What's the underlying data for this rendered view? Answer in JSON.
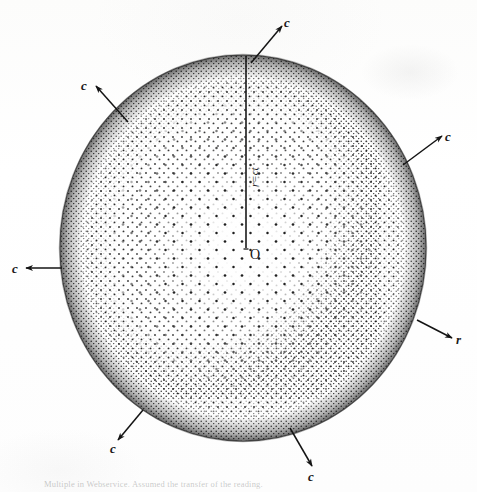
{
  "figure": {
    "background_color": "#fdfdfc",
    "ink_color": "#161616",
    "caption": "Multiple in Webservice. Assumed the transfer of the reading.",
    "sphere": {
      "center_label": "O",
      "center_x": 243,
      "center_y": 248,
      "radius_x": 183,
      "radius_y": 193,
      "edge_color": "#2a2a2a",
      "fill_style": "stipple"
    },
    "radius_line": {
      "label": "r=ct",
      "from_label": "O",
      "direction": "up",
      "x": 246,
      "y_top": 55,
      "y_bottom": 248
    },
    "vectors": [
      {
        "id": "vector-top",
        "label": "c",
        "angle_deg": 72,
        "label_x": 286,
        "label_y": 28
      },
      {
        "id": "vector-upper-left",
        "label": "c",
        "angle_deg": 143,
        "label_x": 86,
        "label_y": 87
      },
      {
        "id": "vector-upper-right",
        "label": "c",
        "angle_deg": 27,
        "label_x": 447,
        "label_y": 139
      },
      {
        "id": "vector-left",
        "label": "c",
        "angle_deg": 180,
        "label_x": 16,
        "label_y": 272
      },
      {
        "id": "vector-right-radius",
        "label": "r",
        "angle_deg": -20,
        "label_x": 459,
        "label_y": 340
      },
      {
        "id": "vector-lower-left",
        "label": "c",
        "angle_deg": -118,
        "label_x": 115,
        "label_y": 447
      },
      {
        "id": "vector-bottom",
        "label": "c",
        "angle_deg": -75,
        "label_x": 314,
        "label_y": 478
      }
    ]
  }
}
